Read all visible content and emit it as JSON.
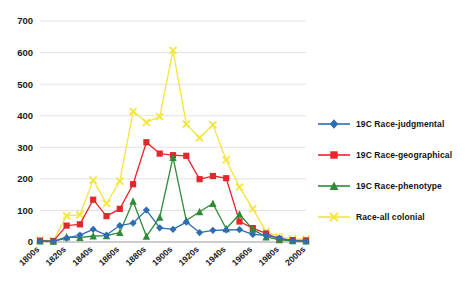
{
  "chart_data": {
    "type": "line",
    "title": "",
    "subtitle": "",
    "xlabel": "",
    "ylabel": "",
    "ylim": [
      0,
      700
    ],
    "ytick_values": [
      0,
      100,
      200,
      300,
      400,
      500,
      600,
      700
    ],
    "ytick_labels": [
      "0",
      "100",
      "200",
      "300",
      "400",
      "500",
      "600",
      "700"
    ],
    "grid": true,
    "grid_axis": "y",
    "legend_position": "right",
    "x": [
      "1800s",
      "1810s",
      "1820s",
      "1830s",
      "1840s",
      "1850s",
      "1860s",
      "1870s",
      "1880s",
      "1890s",
      "1900s",
      "1910s",
      "1920s",
      "1930s",
      "1940s",
      "1950s",
      "1960s",
      "1970s",
      "1980s",
      "1990s",
      "2000s"
    ],
    "xtick_labels": [
      "1800s",
      "1820s",
      "1840s",
      "1860s",
      "1880s",
      "1900s",
      "1920s",
      "1940s",
      "1960s",
      "1980s",
      "2000s"
    ],
    "xtick_every": 2,
    "series": [
      {
        "name": "19C Race-judgmental",
        "color": "#2E6DB4",
        "marker": "diamond",
        "values": [
          3,
          2,
          12,
          22,
          40,
          22,
          52,
          60,
          101,
          45,
          40,
          63,
          30,
          37,
          38,
          39,
          24,
          21,
          12,
          4,
          2
        ]
      },
      {
        "name": "19C Race-geographical",
        "color": "#E8252A",
        "marker": "square",
        "values": [
          4,
          3,
          52,
          56,
          134,
          82,
          105,
          183,
          316,
          280,
          275,
          273,
          199,
          209,
          202,
          65,
          44,
          27,
          9,
          6,
          5
        ]
      },
      {
        "name": "19C Race-phenotype",
        "color": "#2E8B36",
        "marker": "triangle",
        "values": [
          3,
          2,
          16,
          14,
          19,
          20,
          30,
          129,
          18,
          78,
          268,
          68,
          96,
          122,
          42,
          88,
          40,
          16,
          7,
          4,
          3
        ]
      },
      {
        "name": "Race-all colonial",
        "color": "#F5E53C",
        "marker": "x",
        "values": [
          6,
          4,
          83,
          86,
          196,
          122,
          193,
          414,
          379,
          397,
          607,
          373,
          330,
          371,
          260,
          174,
          105,
          33,
          16,
          10,
          9
        ]
      }
    ]
  },
  "legend": {
    "items": [
      {
        "label": "19C Race-judgmental",
        "color": "#2E6DB4",
        "marker": "diamond"
      },
      {
        "label": "19C Race-geographical",
        "color": "#E8252A",
        "marker": "square"
      },
      {
        "label": "19C Race-phenotype",
        "color": "#2E8B36",
        "marker": "triangle"
      },
      {
        "label": "Race-all colonial",
        "color": "#F5E53C",
        "marker": "x"
      }
    ]
  },
  "axis": {
    "gridline_color": "#E2E2E2",
    "axis_color": "#9A9A9A",
    "tick_label_color": "#1A1A1A"
  }
}
